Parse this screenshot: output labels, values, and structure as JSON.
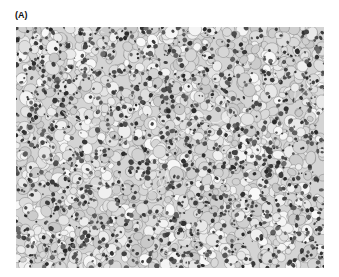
{
  "figure": {
    "panel_label": "(A)",
    "image_description": "Grayscale histology micrograph showing densely packed cells with clear cytoplasm and dark nuclei",
    "colors": {
      "background": "#ffffff",
      "tissue_light": "#e6e6e6",
      "tissue_mid": "#9a9a9a",
      "nucleus": "#3a3a3a"
    }
  }
}
